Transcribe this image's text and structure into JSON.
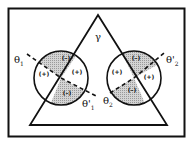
{
  "diagram": {
    "apex_label": "γ",
    "left_circle": {
      "outer_angle_label": "θ",
      "outer_angle_sub": "1",
      "inner_angle_label": "θ'",
      "inner_angle_sub": "1",
      "regions": [
        {
          "sign": "(–)",
          "shaded": true,
          "position": "top"
        },
        {
          "sign": "(+)",
          "shaded": false,
          "position": "left"
        },
        {
          "sign": "(+)",
          "shaded": false,
          "position": "right"
        },
        {
          "sign": "(–)",
          "shaded": true,
          "position": "bottom"
        }
      ]
    },
    "right_circle": {
      "outer_angle_label": "θ'",
      "outer_angle_sub": "2",
      "inner_angle_label": "θ",
      "inner_angle_sub": "2",
      "regions": [
        {
          "sign": "(–)",
          "shaded": true,
          "position": "top"
        },
        {
          "sign": "(+)",
          "shaded": false,
          "position": "left"
        },
        {
          "sign": "(+)",
          "shaded": false,
          "position": "right"
        },
        {
          "sign": "(–)",
          "shaded": true,
          "position": "bottom"
        }
      ]
    },
    "colors": {
      "line": "#111111",
      "shade": "#c8c8c8",
      "background": "#ffffff"
    }
  }
}
